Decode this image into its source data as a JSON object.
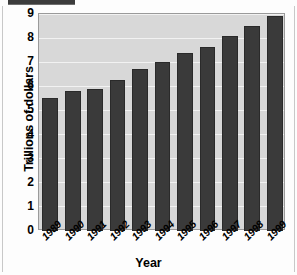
{
  "chart_data": {
    "type": "bar",
    "title": "",
    "xlabel": "Year",
    "ylabel": "Trillions of dollars",
    "categories": [
      "1989",
      "1990",
      "1991",
      "1992",
      "1993",
      "1994",
      "1995",
      "1996",
      "1997",
      "1998",
      "1999"
    ],
    "values": [
      5.5,
      5.8,
      5.9,
      6.25,
      6.7,
      7.0,
      7.4,
      7.65,
      8.1,
      8.5,
      8.9
    ],
    "ylim": [
      0,
      9
    ],
    "yticks": [
      "0",
      "1",
      "2",
      "3",
      "4",
      "5",
      "6",
      "7",
      "8",
      "9"
    ],
    "ytick_values": [
      0,
      1,
      2,
      3,
      4,
      5,
      6,
      7,
      8,
      9
    ],
    "grid": "horizontal",
    "legend": "none",
    "bar_color": "#3a3a3a",
    "plot_background": "#d8d8d8",
    "gridline_color": "#f2f2f2"
  }
}
